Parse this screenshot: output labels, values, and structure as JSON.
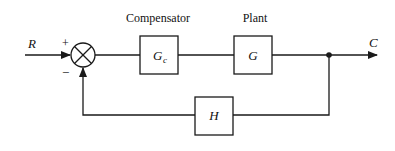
{
  "diagram": {
    "type": "feedback-control-block-diagram",
    "input_signal": "R",
    "output_signal": "C",
    "summing_junction": {
      "plus_sign": "+",
      "minus_sign": "−"
    },
    "blocks": [
      {
        "id": "compensator",
        "caption": "Compensator",
        "symbol": "G",
        "subscript": "c"
      },
      {
        "id": "plant",
        "caption": "Plant",
        "symbol": "G",
        "subscript": ""
      },
      {
        "id": "feedback",
        "caption": "",
        "symbol": "H",
        "subscript": ""
      }
    ],
    "colors": {
      "stroke": "#1a1a1a",
      "background": "#ffffff"
    }
  }
}
